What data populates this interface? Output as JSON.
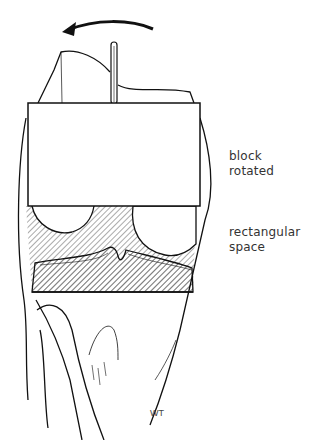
{
  "figure": {
    "type": "surgical illustration",
    "arrow_direction": "counterclockwise (right to left)"
  },
  "labels": {
    "block": [
      "block",
      "rotated"
    ],
    "space": [
      "rectangular",
      "space"
    ]
  },
  "signature": "WT",
  "colors": {
    "ink": "#111111",
    "background": "#ffffff",
    "hatch": "#555555"
  }
}
